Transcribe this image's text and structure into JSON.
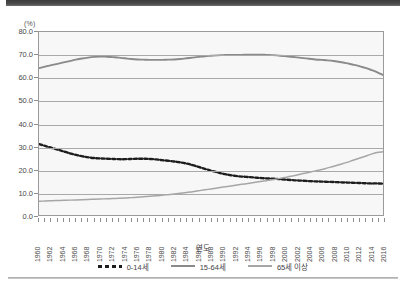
{
  "chart_data": {
    "type": "line",
    "title": "",
    "unit_label": "(%)",
    "xlabel": "연도",
    "ylabel": "",
    "ylim": [
      0,
      80
    ],
    "ytick_step": 10,
    "grid": true,
    "legend_position": "bottom",
    "ytick_labels": [
      "0.0",
      "10.0",
      "20.0",
      "30.0",
      "40.0",
      "50.0",
      "60.0",
      "70.0",
      "80.0"
    ],
    "categories": [
      1960,
      1961,
      1962,
      1963,
      1964,
      1965,
      1966,
      1967,
      1968,
      1969,
      1970,
      1971,
      1972,
      1973,
      1974,
      1975,
      1976,
      1977,
      1978,
      1979,
      1980,
      1981,
      1982,
      1983,
      1984,
      1985,
      1986,
      1987,
      1988,
      1989,
      1990,
      1991,
      1992,
      1993,
      1994,
      1995,
      1996,
      1997,
      1998,
      1999,
      2000,
      2001,
      2002,
      2003,
      2004,
      2005,
      2006,
      2007,
      2008,
      2009,
      2010,
      2011,
      2012,
      2013,
      2014,
      2015,
      2016
    ],
    "xtick_labels": [
      "1960",
      "1962",
      "1964",
      "1966",
      "1968",
      "1970",
      "1972",
      "1974",
      "1976",
      "1978",
      "1980",
      "1982",
      "1984",
      "1986",
      "1988",
      "1990",
      "1992",
      "1994",
      "1996",
      "1998",
      "2000",
      "2002",
      "2004",
      "2006",
      "2008",
      "2010",
      "2012",
      "2014",
      "2016"
    ],
    "series": [
      {
        "name": "0-14세",
        "style": "dashed",
        "color": "#1d1d1d",
        "values": [
          31.0,
          30.2,
          29.4,
          28.6,
          27.8,
          27.0,
          26.3,
          25.7,
          25.2,
          24.9,
          24.7,
          24.6,
          24.5,
          24.4,
          24.4,
          24.5,
          24.6,
          24.6,
          24.5,
          24.3,
          24.0,
          23.7,
          23.4,
          23.0,
          22.5,
          21.8,
          21.0,
          20.2,
          19.4,
          18.7,
          18.0,
          17.5,
          17.1,
          16.8,
          16.6,
          16.4,
          16.2,
          16.0,
          15.9,
          15.7,
          15.5,
          15.3,
          15.1,
          15.0,
          14.8,
          14.7,
          14.6,
          14.5,
          14.4,
          14.3,
          14.2,
          14.1,
          14.0,
          13.9,
          13.8,
          13.8,
          13.7
        ]
      },
      {
        "name": "15-64세",
        "style": "solid",
        "color": "#8a8a8a",
        "values": [
          64.2,
          64.9,
          65.5,
          66.1,
          66.7,
          67.3,
          67.9,
          68.4,
          68.8,
          69.1,
          69.3,
          69.2,
          69.0,
          68.8,
          68.5,
          68.2,
          68.0,
          67.9,
          67.8,
          67.8,
          67.8,
          67.9,
          68.0,
          68.2,
          68.5,
          68.8,
          69.1,
          69.4,
          69.6,
          69.8,
          69.9,
          70.0,
          70.0,
          70.0,
          70.1,
          70.1,
          70.1,
          70.0,
          69.9,
          69.7,
          69.5,
          69.2,
          68.9,
          68.6,
          68.3,
          68.0,
          67.8,
          67.6,
          67.3,
          66.9,
          66.4,
          65.8,
          65.2,
          64.4,
          63.5,
          62.5,
          61.2
        ]
      },
      {
        "name": "65세 이상",
        "style": "solid",
        "color": "#a6a6a6",
        "values": [
          6.0,
          6.1,
          6.2,
          6.3,
          6.4,
          6.5,
          6.6,
          6.7,
          6.8,
          6.9,
          7.0,
          7.1,
          7.2,
          7.3,
          7.4,
          7.6,
          7.8,
          8.0,
          8.2,
          8.4,
          8.6,
          8.9,
          9.2,
          9.5,
          9.8,
          10.2,
          10.6,
          11.0,
          11.4,
          11.8,
          12.2,
          12.6,
          13.0,
          13.4,
          13.8,
          14.2,
          14.6,
          15.0,
          15.4,
          15.9,
          16.4,
          16.9,
          17.5,
          18.1,
          18.7,
          19.3,
          19.9,
          20.6,
          21.3,
          22.1,
          22.9,
          23.8,
          24.7,
          25.6,
          26.5,
          27.3,
          27.6
        ]
      }
    ]
  }
}
